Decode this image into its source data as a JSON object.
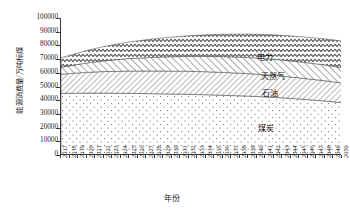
{
  "axes": {
    "y_title": "能源消费量/万吨标煤",
    "x_title": "年份",
    "y_ticks": [
      "0",
      "10000",
      "20000",
      "30000",
      "40000",
      "50000",
      "60000",
      "70000",
      "80000",
      "90000",
      "100000"
    ],
    "x_ticks": [
      "2017",
      "2018",
      "2019",
      "2020",
      "2021",
      "2022",
      "2023",
      "2024",
      "2025",
      "2026",
      "2027",
      "2028",
      "2029",
      "2030",
      "2031",
      "2032",
      "2033",
      "2034",
      "2035",
      "2036",
      "2037",
      "2038",
      "2039",
      "2040",
      "2041",
      "2042",
      "2043",
      "2044",
      "2045",
      "2046",
      "2047",
      "2048",
      "2049",
      "2050"
    ]
  },
  "series_labels": {
    "electricity": "电力",
    "natural_gas": "天然气",
    "oil": "石油",
    "coal": "煤炭"
  },
  "chart_data": {
    "type": "area",
    "stacked": true,
    "title": "",
    "xlabel": "年份",
    "ylabel": "能源消费量/万吨标煤",
    "ylim": [
      0,
      100000
    ],
    "ytick_step": 10000,
    "grid": false,
    "legend": "in-plot series labels, right side",
    "x": [
      2017,
      2018,
      2019,
      2020,
      2021,
      2022,
      2023,
      2024,
      2025,
      2026,
      2027,
      2028,
      2029,
      2030,
      2031,
      2032,
      2033,
      2034,
      2035,
      2036,
      2037,
      2038,
      2039,
      2040,
      2041,
      2042,
      2043,
      2044,
      2045,
      2046,
      2047,
      2048,
      2049,
      2050
    ],
    "categories": [
      "2017",
      "2018",
      "2019",
      "2020",
      "2021",
      "2022",
      "2023",
      "2024",
      "2025",
      "2026",
      "2027",
      "2028",
      "2029",
      "2030",
      "2031",
      "2032",
      "2033",
      "2034",
      "2035",
      "2036",
      "2037",
      "2038",
      "2039",
      "2040",
      "2041",
      "2042",
      "2043",
      "2044",
      "2045",
      "2046",
      "2047",
      "2048",
      "2049",
      "2050"
    ],
    "series": [
      {
        "name": "煤炭",
        "pattern": "dots",
        "values": [
          45000,
          45000,
          45100,
          45200,
          45200,
          45200,
          45100,
          45000,
          45000,
          44900,
          44800,
          44700,
          44600,
          44500,
          44400,
          44300,
          44100,
          44000,
          43800,
          43600,
          43400,
          43200,
          43000,
          42700,
          42400,
          42100,
          41700,
          41300,
          40900,
          40400,
          39900,
          39400,
          38800,
          38200
        ]
      },
      {
        "name": "石油",
        "pattern": "fine-diagonal-hatch",
        "values": [
          14000,
          14400,
          14800,
          15100,
          15400,
          15700,
          15900,
          16100,
          16300,
          16400,
          16500,
          16600,
          16700,
          16700,
          16800,
          16800,
          16800,
          16800,
          16700,
          16700,
          16600,
          16500,
          16400,
          16300,
          16100,
          16000,
          15800,
          15600,
          15400,
          15200,
          15000,
          14800,
          14600,
          14300
        ]
      },
      {
        "name": "天然气",
        "pattern": "diagonal-hatch",
        "values": [
          5000,
          5600,
          6200,
          6800,
          7300,
          7800,
          8300,
          8700,
          9100,
          9400,
          9700,
          10000,
          10300,
          10500,
          10700,
          10900,
          11100,
          11200,
          11400,
          11500,
          11600,
          11700,
          11700,
          11800,
          11800,
          11800,
          11800,
          11800,
          11700,
          11700,
          11600,
          11500,
          11400,
          11300
        ]
      },
      {
        "name": "电力",
        "pattern": "wave-hatch",
        "values": [
          7000,
          7700,
          8400,
          9100,
          9800,
          10400,
          11000,
          11600,
          12100,
          12600,
          13100,
          13500,
          13900,
          14300,
          14700,
          15000,
          15400,
          15700,
          16000,
          16300,
          16600,
          16800,
          17100,
          17300,
          17600,
          17800,
          18000,
          18200,
          18400,
          18600,
          18800,
          19000,
          19200,
          19400
        ]
      }
    ],
    "totals": [
      71000,
      72700,
      74500,
      76200,
      77700,
      79100,
      80300,
      81400,
      82500,
      83300,
      84100,
      84800,
      85500,
      86000,
      86600,
      87000,
      87400,
      87700,
      87900,
      88100,
      88200,
      88200,
      88200,
      88100,
      87900,
      87700,
      87300,
      86900,
      86400,
      85900,
      85300,
      84700,
      84000,
      83200
    ]
  },
  "colors": {
    "axis": "#3a3a3a",
    "text": "#1a1a1a",
    "background": "#ffffff",
    "pattern_stroke": "#555555"
  }
}
